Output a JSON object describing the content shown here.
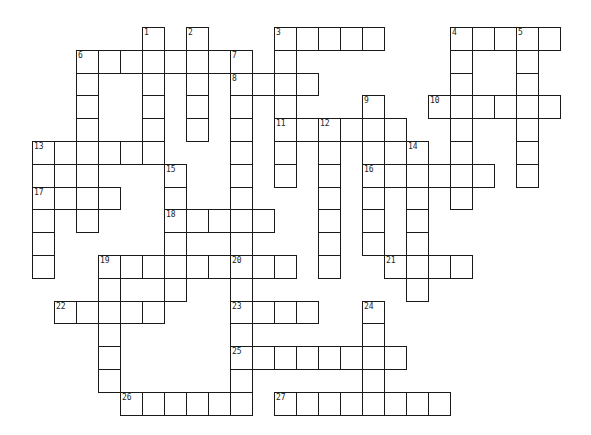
{
  "puzzle": {
    "title": "",
    "grid": {
      "origin_x": 32,
      "origin_y": 27,
      "cell_width": 22,
      "cell_height": 22.8,
      "line_color": "#1a1a1a",
      "cell_color": "#ffffff"
    },
    "clues": [
      {
        "number": 1,
        "direction": "down",
        "row": 0,
        "col": 5,
        "length": 6
      },
      {
        "number": 2,
        "direction": "down",
        "row": 0,
        "col": 7,
        "length": 5
      },
      {
        "number": 3,
        "direction": "across",
        "row": 0,
        "col": 11,
        "length": 5
      },
      {
        "number": 3,
        "direction": "down",
        "row": 0,
        "col": 11,
        "length": 7
      },
      {
        "number": 4,
        "direction": "across",
        "row": 0,
        "col": 19,
        "length": 5
      },
      {
        "number": 4,
        "direction": "down",
        "row": 0,
        "col": 19,
        "length": 8
      },
      {
        "number": 5,
        "direction": "down",
        "row": 0,
        "col": 22,
        "length": 7
      },
      {
        "number": 6,
        "direction": "across",
        "row": 1,
        "col": 2,
        "length": 8
      },
      {
        "number": 6,
        "direction": "down",
        "row": 1,
        "col": 2,
        "length": 8
      },
      {
        "number": 7,
        "direction": "down",
        "row": 1,
        "col": 9,
        "length": 9
      },
      {
        "number": 8,
        "direction": "across",
        "row": 2,
        "col": 9,
        "length": 4
      },
      {
        "number": 9,
        "direction": "down",
        "row": 3,
        "col": 15,
        "length": 7
      },
      {
        "number": 10,
        "direction": "across",
        "row": 3,
        "col": 18,
        "length": 6
      },
      {
        "number": 11,
        "direction": "across",
        "row": 4,
        "col": 11,
        "length": 6
      },
      {
        "number": 12,
        "direction": "down",
        "row": 4,
        "col": 13,
        "length": 7
      },
      {
        "number": 13,
        "direction": "across",
        "row": 5,
        "col": 0,
        "length": 6
      },
      {
        "number": 13,
        "direction": "down",
        "row": 5,
        "col": 0,
        "length": 6
      },
      {
        "number": 14,
        "direction": "down",
        "row": 5,
        "col": 17,
        "length": 7
      },
      {
        "number": 15,
        "direction": "down",
        "row": 6,
        "col": 6,
        "length": 6
      },
      {
        "number": 16,
        "direction": "across",
        "row": 6,
        "col": 15,
        "length": 6
      },
      {
        "number": 17,
        "direction": "across",
        "row": 7,
        "col": 0,
        "length": 4
      },
      {
        "number": 18,
        "direction": "across",
        "row": 8,
        "col": 6,
        "length": 5
      },
      {
        "number": 19,
        "direction": "across",
        "row": 10,
        "col": 3,
        "length": 9
      },
      {
        "number": 19,
        "direction": "down",
        "row": 10,
        "col": 3,
        "length": 6
      },
      {
        "number": 20,
        "direction": "down",
        "row": 10,
        "col": 9,
        "length": 7
      },
      {
        "number": 21,
        "direction": "across",
        "row": 10,
        "col": 16,
        "length": 4
      },
      {
        "number": 22,
        "direction": "across",
        "row": 12,
        "col": 1,
        "length": 5
      },
      {
        "number": 23,
        "direction": "across",
        "row": 12,
        "col": 9,
        "length": 4
      },
      {
        "number": 24,
        "direction": "down",
        "row": 12,
        "col": 15,
        "length": 5
      },
      {
        "number": 25,
        "direction": "across",
        "row": 14,
        "col": 9,
        "length": 8
      },
      {
        "number": 26,
        "direction": "across",
        "row": 16,
        "col": 4,
        "length": 6
      },
      {
        "number": 27,
        "direction": "across",
        "row": 16,
        "col": 11,
        "length": 8
      }
    ],
    "extra_cells": [
      {
        "row": 5,
        "col": 1
      },
      {
        "row": 6,
        "col": 1
      },
      {
        "row": 7,
        "col": 1
      },
      {
        "row": 5,
        "col": 16
      }
    ],
    "entries": {}
  }
}
